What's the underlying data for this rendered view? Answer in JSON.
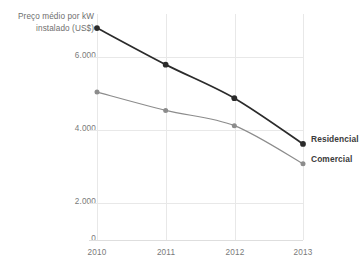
{
  "chart_data": {
    "type": "line",
    "title": "",
    "subtitle": "",
    "xlabel": "",
    "ylabel": "Preço médio por kW instalado (US$)",
    "ylabel_lines": [
      "Preço médio por kW",
      "instalado (US$)"
    ],
    "categories": [
      "2010",
      "2011",
      "2012",
      "2013"
    ],
    "x": [
      2010,
      2011,
      2012,
      2013
    ],
    "series": [
      {
        "name": "Residencial",
        "values": [
          6950,
          5750,
          4650,
          3150
        ],
        "color": "#2b2b2b"
      },
      {
        "name": "Comercial",
        "values": [
          4850,
          4250,
          3750,
          2500
        ],
        "color": "#8c8c8c"
      }
    ],
    "ylim": [
      0,
      7200
    ],
    "yticks": [
      0,
      2000,
      4000,
      6000
    ],
    "ytick_labels": [
      "0",
      "2.000",
      "4.000",
      "6.000"
    ],
    "xtick_labels": [
      "2010",
      "2011",
      "2012",
      "2013"
    ],
    "grid": true,
    "grid_color": "#e8e8e8",
    "legend_position": "right-inline",
    "background": "#ffffff"
  },
  "legend": {
    "items": [
      {
        "label": "Residencial",
        "color": "#2b2b2b"
      },
      {
        "label": "Comercial",
        "color": "#8c8c8c"
      }
    ]
  },
  "axis": {
    "y_title_line1": "Preço médio por kW",
    "y_title_line2": "instalado (US$)",
    "ytick_0": "0",
    "ytick_1": "2.000",
    "ytick_2": "4.000",
    "ytick_3": "6.000",
    "xtick_0": "2010",
    "xtick_1": "2011",
    "xtick_2": "2012",
    "xtick_3": "2013"
  }
}
